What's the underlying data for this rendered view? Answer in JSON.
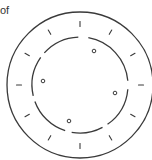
{
  "caption": {
    "text": "of"
  },
  "diagram": {
    "stroke_color": "#3a3a3a",
    "center": [
      80,
      85
    ],
    "outer_ring": {
      "radius": 73
    },
    "inner_ring": {
      "radius": 48,
      "segments": [
        {
          "start_deg": -80,
          "end_deg": -5
        },
        {
          "start_deg": 5,
          "end_deg": 55
        },
        {
          "start_deg": 62,
          "end_deg": 100
        },
        {
          "start_deg": 108,
          "end_deg": 160
        },
        {
          "start_deg": 167,
          "end_deg": 215
        },
        {
          "start_deg": 222,
          "end_deg": 268
        }
      ]
    },
    "ticks": [
      {
        "angle_deg": -90
      },
      {
        "angle_deg": -60
      },
      {
        "angle_deg": -30
      },
      {
        "angle_deg": 0
      },
      {
        "angle_deg": 30
      },
      {
        "angle_deg": 60
      },
      {
        "angle_deg": 90
      },
      {
        "angle_deg": 120
      },
      {
        "angle_deg": 150
      },
      {
        "angle_deg": 180
      },
      {
        "angle_deg": 210
      },
      {
        "angle_deg": 240
      }
    ],
    "tick_radius": 61,
    "tick_length": 5,
    "markers": [
      {
        "x": 94,
        "y": 51
      },
      {
        "x": 43,
        "y": 81
      },
      {
        "x": 115,
        "y": 93
      },
      {
        "x": 69,
        "y": 121
      }
    ],
    "marker_radius": 1.8
  }
}
